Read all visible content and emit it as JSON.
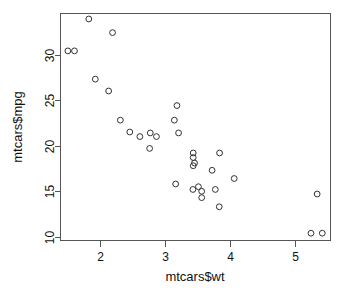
{
  "chart_data": {
    "type": "scatter",
    "title": "",
    "subtitle": "",
    "xlabel": "mtcars$wt",
    "ylabel": "mtcars$mpg",
    "xlim": [
      1.4,
      5.55
    ],
    "ylim": [
      9.6,
      34.5
    ],
    "xticks": [
      2,
      3,
      4,
      5
    ],
    "yticks": [
      10,
      15,
      20,
      25,
      30
    ],
    "xtick_labels": [
      "2",
      "3",
      "4",
      "5"
    ],
    "ytick_labels": [
      "10",
      "15",
      "20",
      "25",
      "30"
    ],
    "grid": false,
    "legend": null,
    "legend_position": "none",
    "marker": "open-circle",
    "marker_color": "#333333",
    "n_points": 32,
    "x": [
      2.62,
      2.875,
      2.32,
      3.215,
      3.44,
      3.46,
      3.57,
      3.19,
      3.15,
      3.44,
      3.44,
      4.07,
      3.73,
      3.78,
      5.25,
      5.424,
      5.345,
      2.2,
      1.615,
      1.835,
      2.465,
      3.52,
      3.435,
      3.84,
      3.845,
      1.935,
      2.14,
      1.513,
      3.17,
      2.77,
      3.57,
      2.78
    ],
    "y": [
      21.0,
      21.0,
      22.8,
      21.4,
      18.7,
      18.1,
      14.3,
      24.4,
      22.8,
      19.2,
      17.8,
      16.4,
      17.3,
      15.2,
      10.4,
      10.4,
      14.7,
      32.4,
      30.4,
      33.9,
      21.5,
      15.5,
      15.2,
      13.3,
      19.2,
      27.3,
      26.0,
      30.4,
      15.8,
      19.7,
      15.0,
      21.4
    ],
    "xlabel_axis_name": "mtcars$wt",
    "ylabel_axis_name": "mtcars$mpg"
  },
  "axes": {
    "x_title": "mtcars$wt",
    "y_title": "mtcars$mpg"
  }
}
